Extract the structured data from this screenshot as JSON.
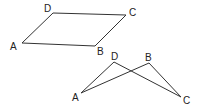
{
  "figure": {
    "stroke_color": "#333333",
    "shapes": [
      {
        "name": "parallelogram",
        "vertices": [
          {
            "label": "A",
            "x": 22,
            "y": 43,
            "lx": 10,
            "ly": 50
          },
          {
            "label": "B",
            "x": 95,
            "y": 46,
            "lx": 97,
            "ly": 55
          },
          {
            "label": "C",
            "x": 126,
            "y": 15,
            "lx": 129,
            "ly": 16
          },
          {
            "label": "D",
            "x": 53,
            "y": 13,
            "lx": 44,
            "ly": 12
          }
        ]
      },
      {
        "name": "crossed-quadrilateral",
        "vertices": [
          {
            "label": "A",
            "x": 81,
            "y": 93,
            "lx": 72,
            "ly": 101
          },
          {
            "label": "B",
            "x": 149,
            "y": 63,
            "lx": 145,
            "ly": 61
          },
          {
            "label": "C",
            "x": 181,
            "y": 97,
            "lx": 183,
            "ly": 104
          },
          {
            "label": "D",
            "x": 114,
            "y": 62,
            "lx": 111,
            "ly": 60
          }
        ]
      }
    ]
  }
}
